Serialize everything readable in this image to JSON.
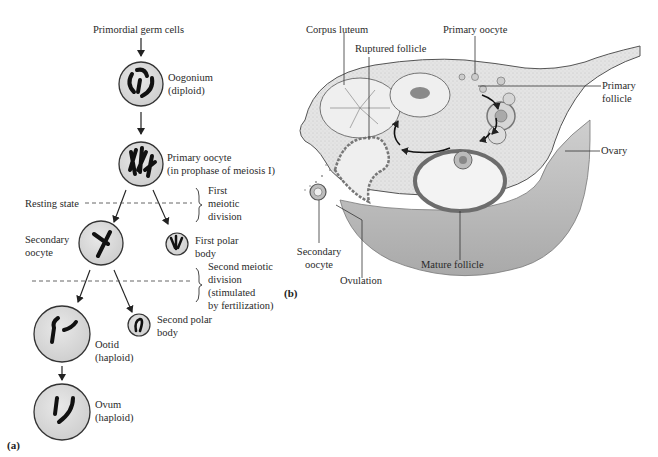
{
  "panel_a": {
    "tag": "(a)",
    "top_label": "Primordial germ cells",
    "oogonium": {
      "name": "Oogonium",
      "ploidy": "(diploid)"
    },
    "primary_oocyte": {
      "name": "Primary oocyte",
      "note": "(in prophase of meiosis I)"
    },
    "resting_state": "Resting state",
    "first_division": {
      "line1": "First",
      "line2": "meiotic",
      "line3": "division"
    },
    "secondary_oocyte": {
      "line1": "Secondary",
      "line2": "oocyte"
    },
    "first_polar_body": {
      "line1": "First polar",
      "line2": "body"
    },
    "second_division": {
      "line1": "Second meiotic",
      "line2": "division",
      "line3": "(stimulated",
      "line4": "by fertilization)"
    },
    "second_polar_body": {
      "line1": "Second polar",
      "line2": "body"
    },
    "ootid": {
      "name": "Ootid",
      "ploidy": "(haploid)"
    },
    "ovum": {
      "name": "Ovum",
      "ploidy": "(haploid)"
    }
  },
  "panel_b": {
    "tag": "(b)",
    "labels": {
      "corpus_luteum": "Corpus luteum",
      "ruptured_follicle": "Ruptured follicle",
      "primary_oocyte": "Primary oocyte",
      "primary_follicle_1": "Primary",
      "primary_follicle_2": "follicle",
      "ovary": "Ovary",
      "secondary_oocyte_1": "Secondary",
      "secondary_oocyte_2": "oocyte",
      "ovulation": "Ovulation",
      "mature_follicle": "Mature follicle"
    }
  },
  "colors": {
    "cell_fill": "#dcdcdc",
    "cell_stroke": "#333333",
    "chromosome": "#1a1a1a",
    "tissue_fill": "#e6e6e6",
    "tissue_shadow": "#bdbdbd",
    "line": "#333333"
  }
}
